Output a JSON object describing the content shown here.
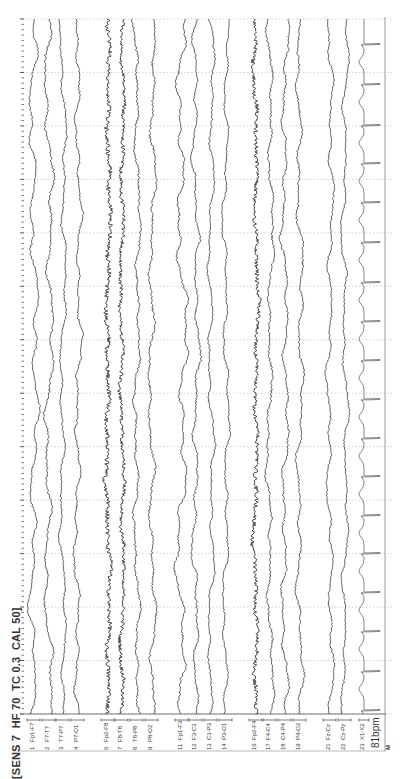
{
  "header": {
    "settings_text": "[SENS 7  HF 70  TC 0.3  CAL 50]",
    "sens": 7,
    "hf": 70,
    "tc": 0.3,
    "cal": 50
  },
  "ecg": {
    "rate_label": "81bpm",
    "bpm": 81
  },
  "marker": "M",
  "colors": {
    "trace": "#3a3a3a",
    "grid": "#c8c8c8",
    "border": "#9a9a9a",
    "ecg": "#6a6a6a"
  },
  "chart_data": {
    "type": "line",
    "orientation": "time runs top-to-bottom, channels left-to-right",
    "settings": {
      "SENS": 7,
      "HF": 70,
      "TC": 0.3,
      "CAL": 50
    },
    "time_grid": {
      "interval_s": 1,
      "count_seconds": 13,
      "grid_style": "dotted"
    },
    "channels": [
      {
        "num": "1",
        "label": "Fp1-F7",
        "x": 34,
        "amp": 3.5,
        "noise": 0.8,
        "slow": 4
      },
      {
        "num": "2",
        "label": "F7-T7",
        "x": 49,
        "amp": 3.5,
        "noise": 1.0,
        "slow": 4
      },
      {
        "num": "3",
        "label": "T7-P7",
        "x": 63,
        "amp": 2.5,
        "noise": 0.8,
        "slow": 3
      },
      {
        "num": "4",
        "label": "P7-O1",
        "x": 78,
        "amp": 3.0,
        "noise": 0.9,
        "slow": 3
      },
      {
        "num": "6",
        "label": "Fp2-F8",
        "x": 108,
        "amp": 2.0,
        "noise": 2.2,
        "slow": 2
      },
      {
        "num": "7",
        "label": "F8-T8",
        "x": 122,
        "amp": 2.0,
        "noise": 1.8,
        "slow": 2
      },
      {
        "num": "8",
        "label": "T8-P8",
        "x": 137,
        "amp": 2.5,
        "noise": 1.0,
        "slow": 3
      },
      {
        "num": "9",
        "label": "P8-O2",
        "x": 152,
        "amp": 3.0,
        "noise": 1.0,
        "slow": 3
      },
      {
        "num": "11",
        "label": "Fp1-F3",
        "x": 182,
        "amp": 4.0,
        "noise": 0.9,
        "slow": 5
      },
      {
        "num": "12",
        "label": "F3-C3",
        "x": 196,
        "amp": 3.0,
        "noise": 0.9,
        "slow": 3
      },
      {
        "num": "13",
        "label": "C3-P3",
        "x": 211,
        "amp": 2.5,
        "noise": 0.8,
        "slow": 3
      },
      {
        "num": "14",
        "label": "P3-O1",
        "x": 226,
        "amp": 2.5,
        "noise": 0.8,
        "slow": 3
      },
      {
        "num": "16",
        "label": "Fp2-F4",
        "x": 256,
        "amp": 2.0,
        "noise": 2.0,
        "slow": 2
      },
      {
        "num": "17",
        "label": "F4-C4",
        "x": 270,
        "amp": 2.5,
        "noise": 1.0,
        "slow": 3
      },
      {
        "num": "18",
        "label": "C4-P4",
        "x": 285,
        "amp": 3.0,
        "noise": 0.9,
        "slow": 3
      },
      {
        "num": "19",
        "label": "P4-O2",
        "x": 300,
        "amp": 3.0,
        "noise": 0.9,
        "slow": 3
      },
      {
        "num": "21",
        "label": "Fz-Cz",
        "x": 330,
        "amp": 2.5,
        "noise": 0.8,
        "slow": 3
      },
      {
        "num": "22",
        "label": "Cz-Pz",
        "x": 345,
        "amp": 2.5,
        "noise": 0.8,
        "slow": 3
      },
      {
        "num": "23",
        "label": "X1-X2",
        "x": 364,
        "type": "ecg"
      }
    ],
    "ecg_r_peaks_y": [
      44,
      84,
      125,
      163,
      202,
      242,
      282,
      321,
      360,
      399,
      438,
      476,
      515,
      553,
      592,
      631,
      671,
      710
    ],
    "heart_rate_bpm": 81
  },
  "layout": {
    "plot_top": 19,
    "plot_bottom": 714,
    "plot_left": 23,
    "plot_right": 385,
    "label_band_bottom": 751,
    "grid_step": 53.46
  }
}
